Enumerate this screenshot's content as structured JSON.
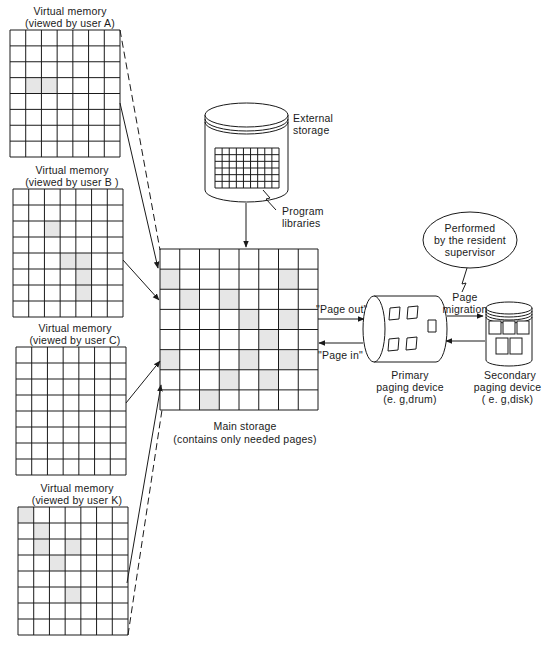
{
  "virtual_memories": [
    {
      "id": "A",
      "title": "Virtual memory",
      "subtitle": "(viewed by user A)",
      "x": 10,
      "y": 30,
      "w": 110,
      "h": 127,
      "rows": 8,
      "cols": 7,
      "shaded": [
        [
          3,
          1
        ],
        [
          3,
          2
        ]
      ],
      "connector": "dashed-and-solid"
    },
    {
      "id": "B",
      "title": "Virtual memory",
      "subtitle": "(viewed by user B )",
      "x": 13,
      "y": 189,
      "w": 110,
      "h": 128,
      "rows": 8,
      "cols": 7,
      "shaded": [
        [
          2,
          2
        ],
        [
          4,
          3
        ],
        [
          4,
          4
        ],
        [
          5,
          4
        ],
        [
          6,
          4
        ]
      ],
      "connector": "solid"
    },
    {
      "id": "C",
      "title": "Virtual memory",
      "subtitle": "(viewed by user C)",
      "x": 16,
      "y": 347,
      "w": 110,
      "h": 128,
      "rows": 8,
      "cols": 7,
      "shaded": [],
      "connector": "solid"
    },
    {
      "id": "K",
      "title": "Virtual memory",
      "subtitle": "(viewed by user K)",
      "x": 18,
      "y": 507,
      "w": 110,
      "h": 128,
      "rows": 8,
      "cols": 7,
      "shaded": [
        [
          0,
          0
        ],
        [
          1,
          1
        ],
        [
          2,
          1
        ],
        [
          2,
          3
        ],
        [
          3,
          2
        ],
        [
          5,
          3
        ]
      ],
      "connector": "solid-and-dashed"
    }
  ],
  "main_storage": {
    "title": "Main storage",
    "subtitle": "(contains only needed pages)",
    "rows": 8,
    "cols": 8,
    "shaded": [
      [
        1,
        0
      ],
      [
        1,
        6
      ],
      [
        2,
        1
      ],
      [
        2,
        3
      ],
      [
        3,
        4
      ],
      [
        3,
        6
      ],
      [
        4,
        5
      ],
      [
        5,
        0
      ],
      [
        5,
        4
      ],
      [
        5,
        6
      ],
      [
        6,
        3
      ],
      [
        6,
        5
      ],
      [
        7,
        2
      ]
    ]
  },
  "external_storage": {
    "title": "External storage",
    "annotation": "Program libraries"
  },
  "primary_device": {
    "title": "Primary",
    "subtitle": "paging device",
    "example": "(e. g,drum)"
  },
  "secondary_device": {
    "title": "Secondary",
    "subtitle": "paging device",
    "example": "( e. g,disk)"
  },
  "supervisor_bubble": {
    "line1": "Performed",
    "line2": "by the resident",
    "line3": "supervisor"
  },
  "flows": {
    "page_out": "\"Page out\"",
    "page_in": "\"Page in\"",
    "page_migration_1": "Page",
    "page_migration_2": "migration"
  },
  "colors": {
    "line": "#1a1a1a",
    "shade": "#e6e6e6",
    "background": "#ffffff"
  }
}
